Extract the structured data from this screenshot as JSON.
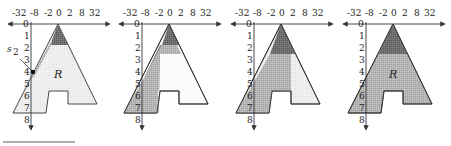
{
  "figure": {
    "x_tick_labels": [
      "-32",
      "-8",
      "-2",
      "0",
      "2",
      "8",
      "32"
    ],
    "y_tick_labels": [
      "0",
      "1",
      "2",
      "3",
      "4",
      "5",
      "6",
      "7",
      "8"
    ],
    "region_label": "R",
    "point_label": "s",
    "point_label_sub": "2",
    "colors": {
      "dark_band": "#6e6e6e",
      "mid_shade": "#b4b4b4",
      "light_fill": "#f0f0f0",
      "white": "#ffffff",
      "stroke": "#333333"
    }
  },
  "panels": [
    {
      "id": 1,
      "show_R": true,
      "show_point": true
    },
    {
      "id": 2,
      "show_R": false,
      "show_point": false
    },
    {
      "id": 3,
      "show_R": false,
      "show_point": false
    },
    {
      "id": 4,
      "show_R": true,
      "show_point": false
    }
  ]
}
